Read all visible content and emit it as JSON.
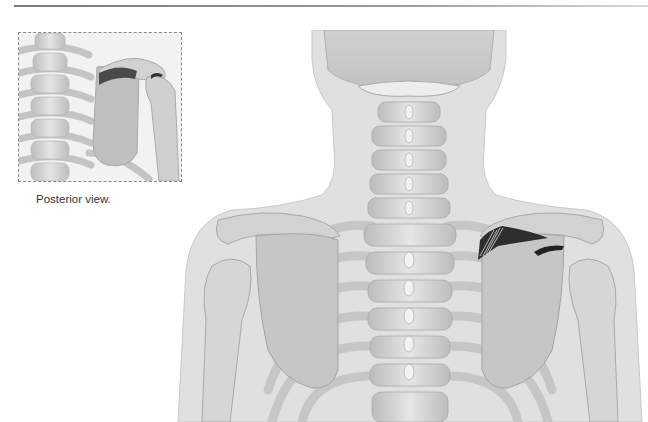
{
  "figure": {
    "inset": {
      "caption": "Posterior view.",
      "view": "posterior",
      "subject": "upper spine, left scapula and shoulder with highlighted supraspinatus muscle"
    },
    "main": {
      "subject": "posterior view of neck, cervical and thoracic spine, scapulae and shoulders",
      "highlight": "supraspinatus muscle and tendon on right-side scapula (image right)"
    },
    "colors": {
      "bone": "#c9c9c9",
      "bone_light": "#e2e2e2",
      "body_outline": "#d6d6d6",
      "muscle": "#3a3a3a",
      "rule": "#8a8a8a"
    }
  }
}
